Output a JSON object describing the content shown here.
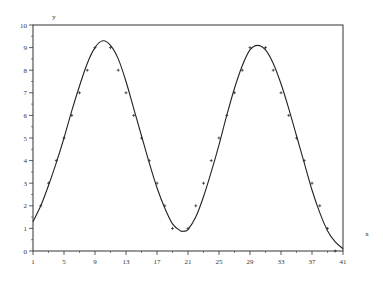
{
  "chart_data": {
    "type": "scatter",
    "title": "",
    "xlabel": "x",
    "ylabel": "y",
    "xlim": [
      1,
      41
    ],
    "ylim": [
      0,
      10
    ],
    "x_ticks": [
      1,
      5,
      9,
      13,
      17,
      21,
      25,
      29,
      33,
      37,
      41
    ],
    "y_ticks": [
      0,
      1,
      2,
      3,
      4,
      5,
      6,
      7,
      8,
      9,
      10
    ],
    "grid": false,
    "legend": null,
    "series": [
      {
        "name": "data points",
        "kind": "scatter",
        "marker": "+",
        "x": [
          2,
          3,
          4,
          5,
          6,
          7,
          8,
          9,
          11,
          12,
          13,
          14,
          15,
          16,
          17,
          18,
          19,
          21,
          22,
          23,
          24,
          25,
          26,
          27,
          28,
          29,
          31,
          32,
          33,
          34,
          35,
          36,
          37,
          38,
          39,
          40
        ],
        "y": [
          2,
          3,
          4,
          5,
          6,
          7,
          8,
          9,
          9,
          8,
          7,
          6,
          5,
          4,
          3,
          2,
          1,
          1,
          2,
          3,
          4,
          5,
          6,
          7,
          8,
          9,
          9,
          8,
          7,
          6,
          5,
          4,
          3,
          2,
          1,
          0
        ]
      },
      {
        "name": "fitted curve",
        "kind": "line",
        "x": [
          1,
          2,
          3,
          4,
          5,
          6,
          7,
          8,
          9,
          10,
          11,
          12,
          13,
          14,
          15,
          16,
          17,
          18,
          19,
          20,
          20.5,
          21,
          22,
          23,
          24,
          25,
          26,
          27,
          28,
          29,
          30,
          31,
          32,
          33,
          34,
          35,
          36,
          37,
          38,
          39,
          40,
          41
        ],
        "y": [
          1.3,
          2.0,
          2.9,
          3.9,
          5.0,
          6.2,
          7.3,
          8.3,
          9.0,
          9.3,
          9.1,
          8.5,
          7.5,
          6.3,
          5.1,
          3.9,
          2.8,
          1.9,
          1.2,
          0.9,
          0.88,
          0.95,
          1.5,
          2.4,
          3.5,
          4.7,
          6.0,
          7.2,
          8.2,
          8.9,
          9.1,
          8.9,
          8.3,
          7.4,
          6.3,
          5.1,
          3.9,
          2.7,
          1.7,
          0.9,
          0.4,
          0.1
        ]
      }
    ],
    "colors": {
      "line": "#222222",
      "frame": "#333333",
      "marker": "#333333"
    }
  }
}
